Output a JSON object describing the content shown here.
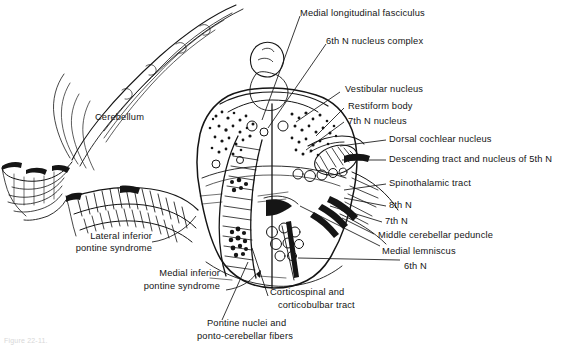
{
  "figure": {
    "type": "anatomical-diagram",
    "background_color": "#ffffff",
    "ink_color": "#151515",
    "caption": "Figure 22-11."
  },
  "labels": {
    "cerebellum": "Cerebellum",
    "medial_longitudinal_fasciculus": "Medial longitudinal fasciculus",
    "sixth_n_nucleus_complex": "6th N nucleus complex",
    "vestibular_nucleus": "Vestibular nucleus",
    "restiform_body": "Restiform body",
    "seventh_n_nucleus": "7th N nucleus",
    "dorsal_cochlear_nucleus": "Dorsal cochlear nucleus",
    "descending_tract_fifth": "Descending tract and nucleus of 5th N",
    "spinothalamic_tract": "Spinothalamic tract",
    "eighth_n": "8th N",
    "seventh_n": "7th N",
    "middle_cerebellar_peduncle": "Middle cerebellar peduncle",
    "medial_lemniscus": "Medial lemniscus",
    "sixth_n": "6th N",
    "lateral_inferior_pontine_syndrome_line1": "Lateral inferior",
    "lateral_inferior_pontine_syndrome_line2": "pontine syndrome",
    "medial_inferior_pontine_syndrome_line1": "Medial inferior",
    "medial_inferior_pontine_syndrome_line2": "pontine syndrome",
    "corticospinal_tract_line1": "Corticospinal and",
    "corticospinal_tract_line2": "corticobulbar tract",
    "pontine_nuclei_line1": "Pontine nuclei and",
    "pontine_nuclei_line2": "ponto-cerebellar fibers"
  }
}
